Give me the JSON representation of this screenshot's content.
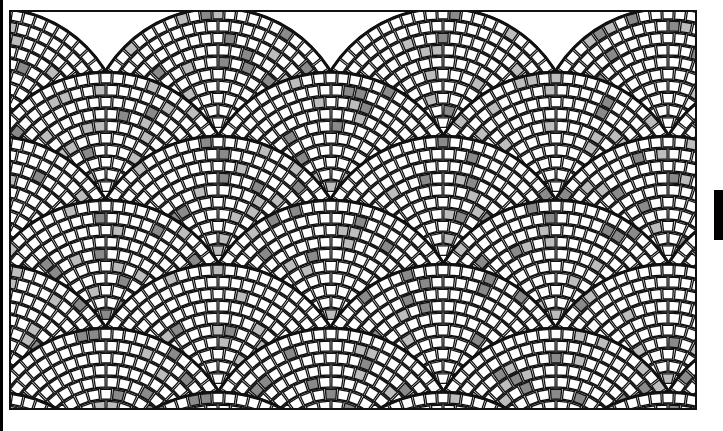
{
  "image": {
    "subject": "fan-pattern cobblestone mosaic",
    "background_color": "#ffffff",
    "grout_color": "#111111",
    "tile_colors": {
      "white": "#ffffff",
      "light_gray": "#bdbdbd",
      "dark_gray": "#8a8a8a"
    },
    "frame": {
      "x": 9,
      "y": 10,
      "width": 688,
      "height": 400
    },
    "side_bar": {
      "x": 714,
      "y": 190,
      "width": 9,
      "height": 50,
      "color": "#000000"
    }
  },
  "pattern": {
    "type": "fan-scale",
    "period_x": 225,
    "row_step_y": 64,
    "row_offset_x": 112,
    "first_apex": {
      "x": 104,
      "y": 70
    },
    "outer_radius": 132,
    "ring_width": 12,
    "tile_arc_length": 12,
    "gray_ratio_dark": 0.06,
    "gray_ratio_light": 0.07
  }
}
